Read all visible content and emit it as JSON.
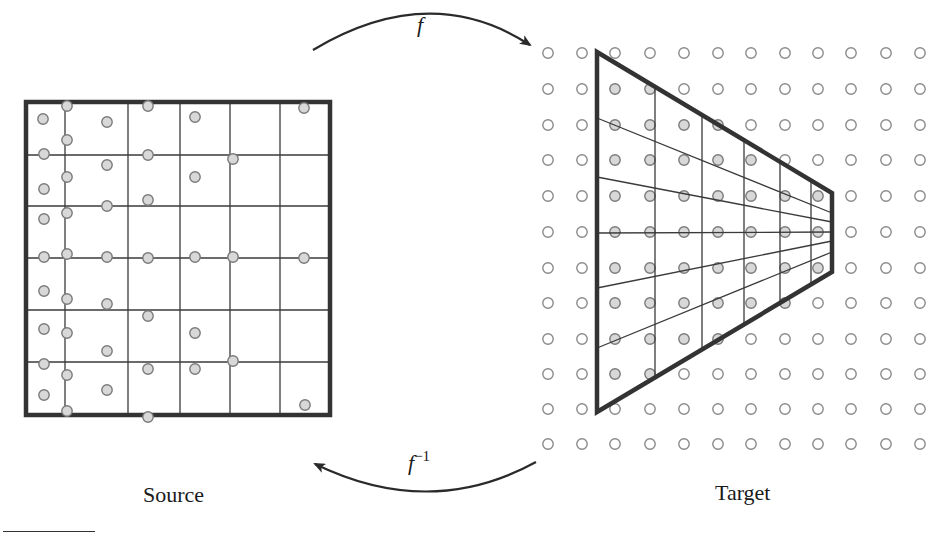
{
  "labels": {
    "source": "Source",
    "target": "Target",
    "forward_map": "f",
    "inverse_map_base": "f",
    "inverse_map_exp": "−1"
  },
  "colors": {
    "stroke": "#3a3a3a",
    "border": "#333333",
    "filled_sample": "#d8d8d8",
    "sample_outline": "#7a7a7a",
    "empty_sample_outline": "#8a8a8a",
    "background": "#ffffff"
  },
  "source": {
    "box": {
      "x1": 26,
      "y1": 102,
      "x2": 330,
      "y2": 415
    },
    "vertical_lines": [
      65,
      128,
      180,
      230,
      280
    ],
    "horizontal_lines": [
      155,
      206,
      258,
      310,
      362
    ],
    "samples": [
      [
        43,
        119
      ],
      [
        67,
        106
      ],
      [
        107,
        122
      ],
      [
        148,
        106
      ],
      [
        195,
        117
      ],
      [
        304,
        108
      ],
      [
        67,
        140
      ],
      [
        44,
        154
      ],
      [
        107,
        165
      ],
      [
        148,
        155
      ],
      [
        233,
        159
      ],
      [
        44,
        189
      ],
      [
        67,
        177
      ],
      [
        107,
        206
      ],
      [
        148,
        200
      ],
      [
        195,
        177
      ],
      [
        44,
        219
      ],
      [
        67,
        213
      ],
      [
        44,
        257
      ],
      [
        67,
        254
      ],
      [
        107,
        257
      ],
      [
        148,
        258
      ],
      [
        195,
        257
      ],
      [
        233,
        257
      ],
      [
        304,
        258
      ],
      [
        44,
        291
      ],
      [
        67,
        299
      ],
      [
        107,
        304
      ],
      [
        148,
        316
      ],
      [
        195,
        333
      ],
      [
        44,
        329
      ],
      [
        67,
        333
      ],
      [
        107,
        351
      ],
      [
        148,
        369
      ],
      [
        233,
        361
      ],
      [
        44,
        364
      ],
      [
        67,
        375
      ],
      [
        107,
        390
      ],
      [
        148,
        417
      ],
      [
        195,
        369
      ],
      [
        44,
        395
      ],
      [
        67,
        411
      ],
      [
        305,
        405
      ]
    ]
  },
  "target": {
    "grid_columns": [
      548,
      582,
      615,
      650,
      684,
      718,
      751,
      785,
      818,
      851,
      886,
      920
    ],
    "grid_rows": [
      53,
      89,
      125,
      160,
      196,
      232,
      268,
      303,
      339,
      374,
      409,
      444
    ],
    "trapezoid": [
      [
        597,
        52
      ],
      [
        832,
        193
      ],
      [
        832,
        272
      ],
      [
        597,
        412
      ]
    ],
    "inner_verticals": [
      655,
      702,
      744,
      780,
      811
    ],
    "fan_lines": [
      {
        "left_y": 118,
        "right_y": 213
      },
      {
        "left_y": 177,
        "right_y": 222
      },
      {
        "left_y": 233,
        "right_y": 232
      },
      {
        "left_y": 288,
        "right_y": 241
      },
      {
        "left_y": 348,
        "right_y": 252
      }
    ]
  },
  "arrows": {
    "forward": {
      "from": [
        313,
        50
      ],
      "control": [
        430,
        -20
      ],
      "to": [
        530,
        45
      ]
    },
    "inverse": {
      "from": [
        536,
        462
      ],
      "control": [
        430,
        520
      ],
      "to": [
        315,
        464
      ]
    }
  }
}
